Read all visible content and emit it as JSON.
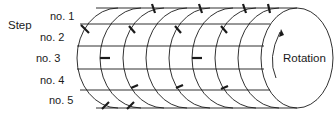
{
  "diagram": {
    "title_label": "Step",
    "steps": [
      {
        "label": "no. 1"
      },
      {
        "label": "no. 2"
      },
      {
        "label": "no. 3"
      },
      {
        "label": "no. 4"
      },
      {
        "label": "no. 5"
      }
    ],
    "rotation_label": "Rotation",
    "colors": {
      "line": "#1a1a1a",
      "background": "#ffffff"
    },
    "arc_count": 9,
    "horizontal_lines": 6
  }
}
